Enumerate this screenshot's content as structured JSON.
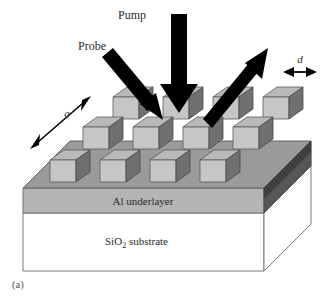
{
  "figure": {
    "caption": "(a)"
  },
  "beams": {
    "pump": {
      "label": "Pump",
      "icon": "down-arrow-icon",
      "direction": "down",
      "color": "#000000"
    },
    "probe": {
      "label": "Probe",
      "icon": "diagonal-down-right-arrow-icon",
      "direction": "down-right",
      "color": "#000000"
    },
    "reflected": {
      "label": "",
      "icon": "diagonal-up-right-arrow-icon",
      "direction": "up-right",
      "color": "#000000"
    }
  },
  "dimensions": {
    "pitch": {
      "label": "a",
      "icon": "double-headed-diagonal-arrow-icon",
      "description": "lattice pitch along the in-plane diagonal"
    },
    "width": {
      "label": "d",
      "icon": "double-headed-horizontal-arrow-icon",
      "description": "nanostructure width"
    }
  },
  "layers": {
    "underlayer": {
      "label": "Al underlayer",
      "color": "#b3b3b3"
    },
    "substrate": {
      "label_main": "SiO",
      "label_sub": "2",
      "label_tail": " substrate",
      "label_full": "SiO2 substrate",
      "color": "#ffffff"
    },
    "grating_slab": {
      "label": "",
      "top_color": "#9a9a9a",
      "edge_color": "#4d4d4d"
    }
  },
  "lattice": {
    "rows": 3,
    "columns_per_row": 4,
    "total_cubes": 12,
    "cube_colors": {
      "top": "#b8b8b8",
      "front": "#c4c4c4",
      "side": "#6e6e6e"
    }
  },
  "palette": {
    "background": "#ffffff",
    "slab_top": "#9a9a9a",
    "slab_edge_dark": "#4d4d4d",
    "underlayer": "#b3b3b3",
    "substrate": "#ffffff",
    "outline": "#555555",
    "arrow": "#000000",
    "text": "#2b2b2b"
  }
}
